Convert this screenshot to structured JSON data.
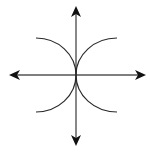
{
  "diagram": {
    "type": "coordinate-axes-with-arcs",
    "background": "#ffffff",
    "axis_color": "#555555",
    "arc_color": "#2a2a2a",
    "arrow_color": "#111111",
    "origin": [
      76,
      75
    ],
    "axes": {
      "horizontal": {
        "from": [
          9,
          75
        ],
        "to": [
          146,
          75
        ],
        "arrows": [
          "left",
          "right"
        ]
      },
      "vertical": {
        "from": [
          76,
          6
        ],
        "to": [
          76,
          146
        ],
        "arrows": [
          "up",
          "down"
        ]
      }
    },
    "arcs": [
      {
        "name": "upper-left",
        "start": [
          36,
          38
        ],
        "end": [
          76,
          75
        ]
      },
      {
        "name": "upper-right",
        "start": [
          117,
          38
        ],
        "end": [
          76,
          75
        ]
      },
      {
        "name": "lower-left",
        "start": [
          36,
          112
        ],
        "end": [
          76,
          75
        ]
      },
      {
        "name": "lower-right",
        "start": [
          117,
          112
        ],
        "end": [
          76,
          75
        ]
      }
    ]
  }
}
